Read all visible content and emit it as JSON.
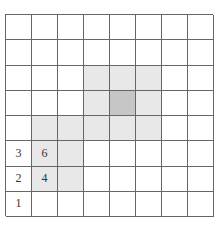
{
  "grid": {
    "rows": 8,
    "cols": 8,
    "colors": {
      "light": "#e8e8e8",
      "dark": "#c6c6c6",
      "line": "#666666"
    },
    "shaded": [
      {
        "r": 2,
        "c": 3,
        "shade": "light"
      },
      {
        "r": 2,
        "c": 4,
        "shade": "light"
      },
      {
        "r": 2,
        "c": 5,
        "shade": "light"
      },
      {
        "r": 3,
        "c": 3,
        "shade": "light"
      },
      {
        "r": 3,
        "c": 4,
        "shade": "dark"
      },
      {
        "r": 3,
        "c": 5,
        "shade": "light"
      },
      {
        "r": 4,
        "c": 1,
        "shade": "light"
      },
      {
        "r": 4,
        "c": 2,
        "shade": "light"
      },
      {
        "r": 4,
        "c": 3,
        "shade": "light"
      },
      {
        "r": 4,
        "c": 4,
        "shade": "light"
      },
      {
        "r": 4,
        "c": 5,
        "shade": "light"
      },
      {
        "r": 5,
        "c": 1,
        "shade": "light"
      },
      {
        "r": 5,
        "c": 2,
        "shade": "light"
      },
      {
        "r": 6,
        "c": 1,
        "shade": "light"
      },
      {
        "r": 6,
        "c": 2,
        "shade": "light"
      }
    ],
    "labels": [
      {
        "r": 5,
        "c": 0,
        "text": "3"
      },
      {
        "r": 5,
        "c": 1,
        "text": "6"
      },
      {
        "r": 6,
        "c": 0,
        "text": "2"
      },
      {
        "r": 6,
        "c": 1,
        "text": "4"
      },
      {
        "r": 7,
        "c": 0,
        "text": "1"
      }
    ]
  }
}
